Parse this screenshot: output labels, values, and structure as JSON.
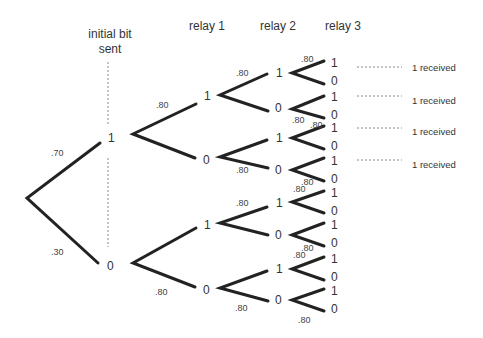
{
  "headers": {
    "initial_line1": "initial bit",
    "initial_line2": "sent",
    "relay1": "relay 1",
    "relay2": "relay 2",
    "relay3": "relay 3"
  },
  "root_branches": {
    "upper_prob": ".70",
    "lower_prob": ".30",
    "upper_node": "1",
    "lower_node": "0"
  },
  "relay1": {
    "nodes": [
      "1",
      "0",
      "1",
      "0"
    ],
    "probs": [
      ".80",
      ".80"
    ]
  },
  "relay2": {
    "nodes": [
      "1",
      "0",
      "1",
      "0",
      "1",
      "0",
      "1",
      "0"
    ],
    "probs": [
      ".80",
      ".80",
      ".80",
      ".80"
    ]
  },
  "relay3": {
    "nodes": [
      "1",
      "0",
      "1",
      "0",
      "1",
      "0",
      "1",
      "0",
      "1",
      "0",
      "1",
      "0",
      "1",
      "0",
      "1",
      "0"
    ],
    "probs": [
      ".80",
      ".80",
      ".80",
      ".80",
      ".80",
      ".80",
      ".80",
      ".80"
    ]
  },
  "outcomes": {
    "received": [
      "1 received",
      "1 received",
      "1 received",
      "1 received"
    ]
  },
  "colors": {
    "line": "#222222",
    "text": "#333333",
    "dotted": "#888888"
  }
}
